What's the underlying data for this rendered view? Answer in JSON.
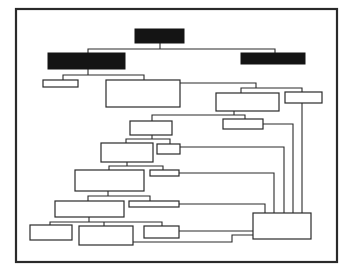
{
  "diagram": {
    "type": "organization-chart",
    "colors": {
      "dark_fill": "#141414",
      "line": "#2a2a2a",
      "background": "#ffffff"
    },
    "nodes": [
      {
        "id": "root",
        "style": "dark",
        "label": ""
      },
      {
        "id": "left-branch",
        "style": "dark",
        "label": ""
      },
      {
        "id": "right-branch",
        "style": "dark",
        "label": ""
      },
      {
        "id": "l1-small",
        "style": "outline",
        "label": ""
      },
      {
        "id": "l1-big",
        "style": "outline",
        "label": ""
      },
      {
        "id": "r2-box",
        "style": "outline",
        "label": ""
      },
      {
        "id": "r2-small",
        "style": "outline",
        "label": ""
      },
      {
        "id": "l3-box",
        "style": "outline",
        "label": ""
      },
      {
        "id": "r3-small",
        "style": "outline",
        "label": ""
      },
      {
        "id": "l4-box",
        "style": "outline",
        "label": ""
      },
      {
        "id": "l4-small",
        "style": "outline",
        "label": ""
      },
      {
        "id": "l5-box",
        "style": "outline",
        "label": ""
      },
      {
        "id": "l5-small",
        "style": "outline",
        "label": ""
      },
      {
        "id": "l6-box",
        "style": "outline",
        "label": ""
      },
      {
        "id": "l6-small",
        "style": "outline",
        "label": ""
      },
      {
        "id": "bottom-a",
        "style": "outline",
        "label": ""
      },
      {
        "id": "bottom-b",
        "style": "outline",
        "label": ""
      },
      {
        "id": "bottom-c",
        "style": "outline",
        "label": ""
      },
      {
        "id": "collector",
        "style": "outline",
        "label": ""
      }
    ],
    "edges": [
      [
        "root",
        "left-branch"
      ],
      [
        "root",
        "right-branch"
      ],
      [
        "left-branch",
        "l1-small"
      ],
      [
        "left-branch",
        "l1-big"
      ],
      [
        "l1-big",
        "r2-box"
      ],
      [
        "l1-big",
        "r2-small"
      ],
      [
        "r2-box",
        "l3-box"
      ],
      [
        "r2-box",
        "r3-small"
      ],
      [
        "l3-box",
        "l4-box"
      ],
      [
        "l3-box",
        "l4-small"
      ],
      [
        "l4-box",
        "l5-box"
      ],
      [
        "l4-box",
        "l5-small"
      ],
      [
        "l5-box",
        "l6-box"
      ],
      [
        "l5-box",
        "l6-small"
      ],
      [
        "l6-box",
        "bottom-a"
      ],
      [
        "l6-box",
        "bottom-b"
      ],
      [
        "l6-box",
        "bottom-c"
      ],
      [
        "r2-small",
        "collector"
      ],
      [
        "r3-small",
        "collector"
      ],
      [
        "l4-small",
        "collector"
      ],
      [
        "l5-small",
        "collector"
      ],
      [
        "l6-small",
        "collector"
      ],
      [
        "bottom-c",
        "collector"
      ],
      [
        "bottom-b",
        "collector"
      ]
    ]
  }
}
